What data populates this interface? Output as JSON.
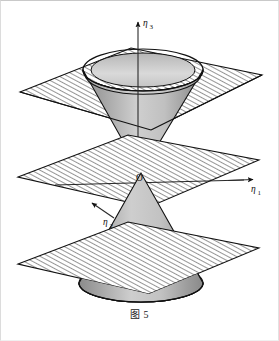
{
  "figure": {
    "caption_prefix": "图",
    "caption_number": "5",
    "origin_label": "O",
    "axes": [
      {
        "key": "eta3",
        "base": "η",
        "sub": "3",
        "name": "axis-label-eta3",
        "direction": "up"
      },
      {
        "key": "eta1",
        "base": "η",
        "sub": "1",
        "name": "axis-label-eta1",
        "direction": "right"
      },
      {
        "key": "eta2",
        "base": "η",
        "sub": "2",
        "name": "axis-label-eta2",
        "direction": "lower-left"
      }
    ],
    "colors": {
      "stroke": "#111111",
      "hatch_line": "#3a3a3a",
      "plane_fill": "#ffffff",
      "cone_light": "#e3e3e3",
      "cone_mid": "#b9b9b9",
      "cone_dark": "#8f8f8f",
      "rim_light": "#d8d8d8",
      "rim_dark": "#a3a3a3",
      "background": "#ffffff",
      "frame": "#d5d5d5"
    },
    "elements": [
      {
        "name": "plane-top",
        "label": "top hatched plane"
      },
      {
        "name": "plane-middle",
        "label": "middle hatched plane"
      },
      {
        "name": "plane-bottom",
        "label": "bottom hatched plane"
      },
      {
        "name": "cone-upper",
        "label": "upper nappe of cone"
      },
      {
        "name": "cone-lower",
        "label": "lower nappe of cone"
      },
      {
        "name": "cone-rim",
        "label": "upper cone rim band"
      },
      {
        "name": "cone-base-cap",
        "label": "lower cone base cap"
      }
    ]
  }
}
